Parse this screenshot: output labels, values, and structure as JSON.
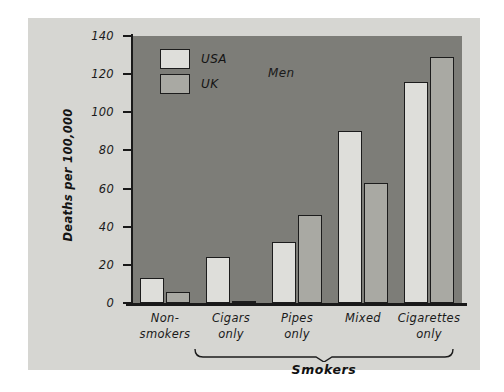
{
  "chart_data": {
    "type": "bar",
    "title": "",
    "annotation": "Men",
    "xlabel": "",
    "ylabel": "Deaths per 100,000",
    "ylim": [
      0,
      140
    ],
    "yticks": [
      0,
      20,
      40,
      60,
      80,
      100,
      120,
      140
    ],
    "ytick_labels": [
      "0",
      "20",
      "40",
      "60",
      "80",
      "100",
      "120",
      "140"
    ],
    "grid": false,
    "legend_position": "upper-left inside plot",
    "categories": [
      "Non-\nsmokers",
      "Cigars\nonly",
      "Pipes\nonly",
      "Mixed",
      "Cigarettes\nonly"
    ],
    "category_labels_flat": [
      "Non-smokers",
      "Cigars only",
      "Pipes only",
      "Mixed",
      "Cigarettes only"
    ],
    "group_bracket": {
      "label": "Smokers",
      "covers": [
        "Cigars only",
        "Pipes only",
        "Mixed",
        "Cigarettes only"
      ]
    },
    "series": [
      {
        "name": "USA",
        "color": "#dededa",
        "values": [
          13,
          24,
          32,
          90,
          116
        ]
      },
      {
        "name": "UK",
        "color": "#a9a9a3",
        "values": [
          6,
          1,
          46,
          63,
          129
        ]
      }
    ]
  },
  "colors": {
    "figure_background": "#d6d6d2",
    "plot_background": "#7d7d78",
    "axis": "#191919",
    "usa_bar": "#dededa",
    "uk_bar": "#a9a9a3"
  }
}
